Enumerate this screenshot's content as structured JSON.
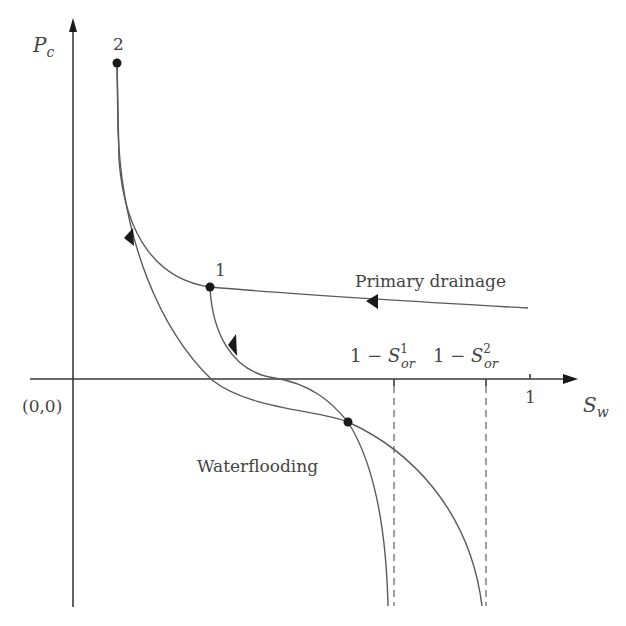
{
  "diagram": {
    "axes": {
      "y_label_main": "P",
      "y_label_sub": "c",
      "x_label_main": "S",
      "x_label_sub": "w",
      "origin_label": "(0,0)",
      "x_tick_one": "1"
    },
    "points": {
      "point_2_label": "2",
      "point_1_label": "1"
    },
    "curve_labels": {
      "primary_drainage": "Primary drainage",
      "waterflooding": "Waterflooding"
    },
    "residual_labels": {
      "first_prefix": "1 − ",
      "first_main": "S",
      "first_sup": "1",
      "first_sub": "or",
      "second_prefix": "1 − ",
      "second_main": "S",
      "second_sup": "2",
      "second_sub": "or"
    },
    "colors": {
      "line": "#5a5a5a",
      "point": "#1a1a1a",
      "text": "#444444",
      "background": "#ffffff"
    }
  }
}
